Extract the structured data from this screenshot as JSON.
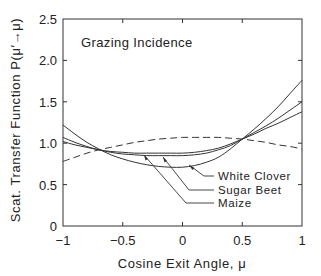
{
  "chart_data": {
    "type": "line",
    "title": "Grazing Incidence",
    "xlabel": "Cosine Exit Angle, μ",
    "ylabel": "Scat. Transfer Function  P(μ′→μ)",
    "xlim": [
      -1,
      1
    ],
    "ylim": [
      0,
      2.5
    ],
    "xticks": [
      "−1",
      "−0.5",
      "0",
      "0.5",
      "1"
    ],
    "yticks": [
      "0",
      "0.5",
      "1.0",
      "1.5",
      "2.0",
      "2.5"
    ],
    "grid": false,
    "legend_position": "annotations with leader arrows, lower-right",
    "x": [
      -1.0,
      -0.9,
      -0.8,
      -0.7,
      -0.6,
      -0.5,
      -0.4,
      -0.3,
      -0.2,
      -0.1,
      0.0,
      0.1,
      0.2,
      0.3,
      0.4,
      0.5,
      0.6,
      0.7,
      0.8,
      0.9,
      1.0
    ],
    "series": [
      {
        "name": "White Clover",
        "style": "solid",
        "values": [
          1.22,
          1.11,
          1.01,
          0.93,
          0.86,
          0.81,
          0.77,
          0.74,
          0.72,
          0.71,
          0.71,
          0.73,
          0.77,
          0.83,
          0.93,
          1.05,
          1.17,
          1.3,
          1.44,
          1.6,
          1.76
        ]
      },
      {
        "name": "Sugar Beet",
        "style": "solid",
        "values": [
          1.07,
          1.01,
          0.96,
          0.92,
          0.89,
          0.87,
          0.86,
          0.85,
          0.85,
          0.85,
          0.85,
          0.86,
          0.88,
          0.92,
          0.97,
          1.05,
          1.13,
          1.21,
          1.3,
          1.4,
          1.5
        ]
      },
      {
        "name": "Maize",
        "style": "solid",
        "values": [
          1.02,
          0.98,
          0.95,
          0.92,
          0.9,
          0.89,
          0.88,
          0.88,
          0.88,
          0.88,
          0.88,
          0.89,
          0.91,
          0.94,
          0.99,
          1.05,
          1.11,
          1.18,
          1.24,
          1.31,
          1.38
        ]
      },
      {
        "name": "(unlabeled dashed reference)",
        "style": "dashed",
        "values": [
          0.78,
          0.83,
          0.88,
          0.92,
          0.95,
          0.98,
          1.01,
          1.03,
          1.05,
          1.06,
          1.07,
          1.07,
          1.07,
          1.07,
          1.06,
          1.05,
          1.03,
          1.01,
          0.98,
          0.96,
          0.93
        ]
      }
    ],
    "annotations": [
      {
        "text": "White Clover",
        "arrow_to": [
          0.05,
          0.72
        ]
      },
      {
        "text": "Sugar Beet",
        "arrow_to": [
          -0.18,
          0.84
        ]
      },
      {
        "text": "Maize",
        "arrow_to": [
          -0.35,
          0.87
        ]
      }
    ]
  },
  "labels": {
    "title": "Grazing Incidence",
    "xlabel": "Cosine Exit Angle, μ",
    "ylabel": "Scat. Transfer Function  P(μ′→μ)",
    "ann_white_clover": "White Clover",
    "ann_sugar_beet": "Sugar Beet",
    "ann_maize": "Maize",
    "xtick_0": "−1",
    "xtick_1": "−0.5",
    "xtick_2": "0",
    "xtick_3": "0.5",
    "xtick_4": "1",
    "ytick_0": "0",
    "ytick_1": "0.5",
    "ytick_2": "1.0",
    "ytick_3": "1.5",
    "ytick_4": "2.0",
    "ytick_5": "2.5"
  },
  "colors": {
    "line": "#333333",
    "axis": "#333333",
    "background": "#ffffff"
  }
}
